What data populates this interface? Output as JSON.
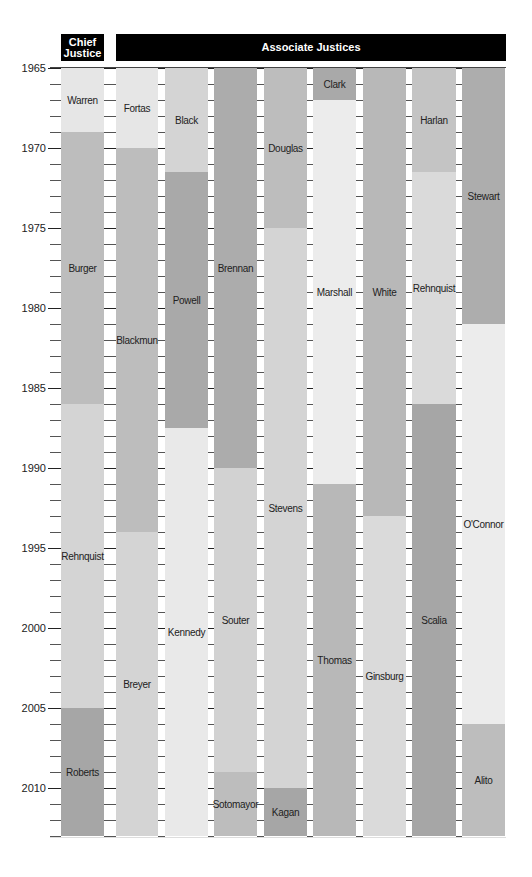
{
  "chart_data": {
    "type": "timeline",
    "title": "",
    "headers": {
      "chief": "Chief Justice",
      "associate": "Associate Justices"
    },
    "xlabel": "",
    "ylabel": "Year",
    "ylim": [
      1965,
      2013
    ],
    "y_ticks_labeled": [
      1965,
      1970,
      1975,
      1980,
      1985,
      1990,
      1995,
      2000,
      2005,
      2010
    ],
    "y_tick_step_minor": 1,
    "columns": [
      {
        "group": "chief",
        "segments": [
          {
            "name": "Warren",
            "start": 1965,
            "end": 1969,
            "color": "#e6e6e6"
          },
          {
            "name": "Burger",
            "start": 1969,
            "end": 1986,
            "color": "#bdbdbd"
          },
          {
            "name": "Rehnquist",
            "start": 1986,
            "end": 2005,
            "color": "#d4d4d4"
          },
          {
            "name": "Roberts",
            "start": 2005,
            "end": 2013,
            "color": "#a6a6a6"
          }
        ]
      },
      {
        "group": "associate",
        "segments": [
          {
            "name": "Fortas",
            "start": 1965,
            "end": 1970,
            "color": "#e6e6e6"
          },
          {
            "name": "Blackmun",
            "start": 1970,
            "end": 1994,
            "color": "#bdbdbd"
          },
          {
            "name": "Breyer",
            "start": 1994,
            "end": 2013,
            "color": "#d4d4d4"
          }
        ]
      },
      {
        "group": "associate",
        "segments": [
          {
            "name": "Black",
            "start": 1965,
            "end": 1971.5,
            "color": "#d4d4d4"
          },
          {
            "name": "Powell",
            "start": 1971.5,
            "end": 1987.5,
            "color": "#a9a9a9"
          },
          {
            "name": "Kennedy",
            "start": 1987.5,
            "end": 2013,
            "color": "#e9e9e9"
          }
        ]
      },
      {
        "group": "associate",
        "segments": [
          {
            "name": "Brennan",
            "start": 1965,
            "end": 1990,
            "color": "#acacac"
          },
          {
            "name": "Souter",
            "start": 1990,
            "end": 2009,
            "color": "#d2d2d2"
          },
          {
            "name": "Sotomayor",
            "start": 2009,
            "end": 2013,
            "color": "#bdbdbd"
          }
        ]
      },
      {
        "group": "associate",
        "segments": [
          {
            "name": "Douglas",
            "start": 1965,
            "end": 1975,
            "color": "#bdbdbd"
          },
          {
            "name": "Stevens",
            "start": 1975,
            "end": 2010,
            "color": "#d4d4d4"
          },
          {
            "name": "Kagan",
            "start": 2010,
            "end": 2013,
            "color": "#a6a6a6"
          }
        ]
      },
      {
        "group": "associate",
        "segments": [
          {
            "name": "Clark",
            "start": 1965,
            "end": 1967,
            "color": "#a9a9a9"
          },
          {
            "name": "Marshall",
            "start": 1967,
            "end": 1991,
            "color": "#ececec"
          },
          {
            "name": "Thomas",
            "start": 1991,
            "end": 2013,
            "color": "#b8b8b8"
          }
        ]
      },
      {
        "group": "associate",
        "segments": [
          {
            "name": "White",
            "start": 1965,
            "end": 1993,
            "color": "#b8b8b8"
          },
          {
            "name": "Ginsburg",
            "start": 1993,
            "end": 2013,
            "color": "#dadada"
          }
        ]
      },
      {
        "group": "associate",
        "segments": [
          {
            "name": "Harlan",
            "start": 1965,
            "end": 1971.5,
            "color": "#c4c4c4"
          },
          {
            "name": "Rehnquist",
            "start": 1971.5,
            "end": 1986,
            "color": "#dadada"
          },
          {
            "name": "Scalia",
            "start": 1986,
            "end": 2013,
            "color": "#a6a6a6"
          }
        ]
      },
      {
        "group": "associate",
        "segments": [
          {
            "name": "Stewart",
            "start": 1965,
            "end": 1981,
            "color": "#adadad"
          },
          {
            "name": "O'Connor",
            "start": 1981,
            "end": 2006,
            "color": "#ececec"
          },
          {
            "name": "Alito",
            "start": 2006,
            "end": 2013,
            "color": "#bdbdbd"
          }
        ]
      }
    ]
  },
  "layout": {
    "y0_year": 1965,
    "y0_px": 68,
    "px_per_year": 16,
    "bottom_px": 837,
    "col_x": [
      [
        61,
        104
      ],
      [
        116,
        158
      ],
      [
        165,
        208
      ],
      [
        214,
        257
      ],
      [
        264,
        307
      ],
      [
        313,
        356
      ],
      [
        363,
        406
      ],
      [
        412,
        456
      ],
      [
        462,
        505
      ]
    ]
  }
}
